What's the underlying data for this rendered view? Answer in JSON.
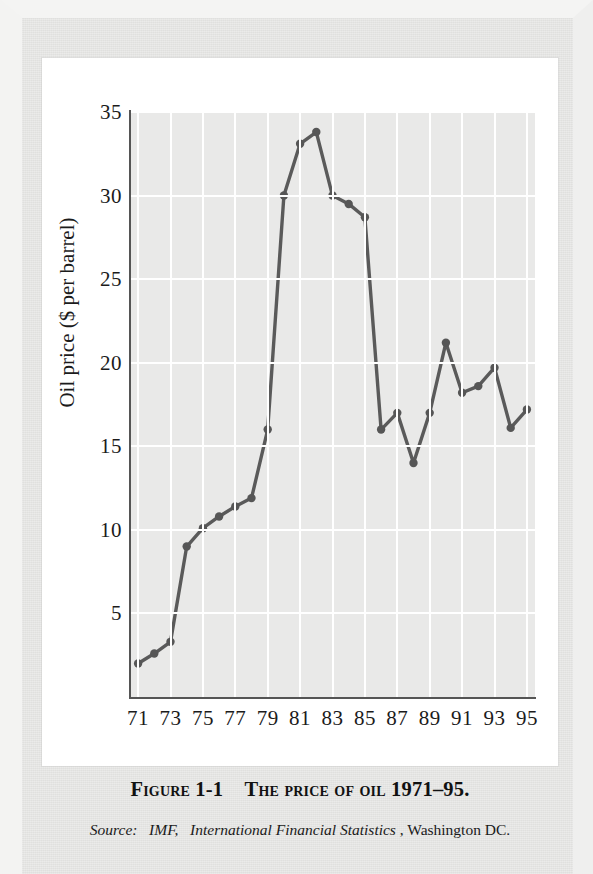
{
  "figure": {
    "caption_prefix": "Figure 1-1",
    "caption_title": "The price of oil 1971–95.",
    "source_label": "Source:",
    "source_publisher": "IMF,",
    "source_publication": "International Financial Statistics",
    "source_location": ", Washington DC."
  },
  "colors": {
    "line": "#5a5a5a",
    "marker": "#565656",
    "plot_background": "#e9e9e8",
    "gridline": "#ffffff",
    "axis": "#555555",
    "page_background": "#e4e4e2",
    "panel_background": "#ffffff",
    "text": "#1b1b1b"
  },
  "chart_data": {
    "type": "line",
    "xlabel": "",
    "ylabel": "Oil price ($ per barrel)",
    "xlim": [
      1970.5,
      1995.5
    ],
    "ylim": [
      0,
      35
    ],
    "grid": true,
    "legend": "none",
    "y_ticks": [
      5,
      10,
      15,
      20,
      25,
      30,
      35
    ],
    "x_ticks": [
      "71",
      "73",
      "75",
      "77",
      "79",
      "81",
      "83",
      "85",
      "87",
      "89",
      "91",
      "93",
      "95"
    ],
    "x": [
      1971,
      1972,
      1973,
      1974,
      1975,
      1976,
      1977,
      1978,
      1979,
      1980,
      1981,
      1982,
      1983,
      1984,
      1985,
      1986,
      1987,
      1988,
      1989,
      1990,
      1991,
      1992,
      1993,
      1994,
      1995
    ],
    "series": [
      {
        "name": "Oil price ($ per barrel)",
        "values": [
          2.0,
          2.6,
          3.3,
          9.0,
          10.1,
          10.8,
          11.4,
          11.9,
          16.0,
          30.0,
          33.1,
          33.8,
          30.0,
          29.5,
          28.7,
          16.0,
          17.0,
          14.0,
          17.0,
          21.2,
          18.2,
          18.6,
          19.7,
          16.1,
          17.2
        ]
      }
    ]
  }
}
